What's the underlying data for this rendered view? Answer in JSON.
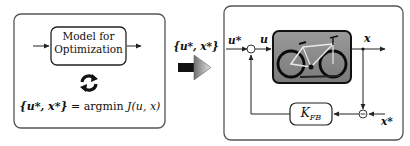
{
  "left_panel": {
    "model_box_line1": "Model for",
    "model_box_line2": "Optimization",
    "loop_icon": "refresh-cycle-icon",
    "equation": {
      "lhs": "{u*, x*}",
      "eq": "=",
      "rhs_op": "argmin",
      "rhs_func": "J(u, x)"
    }
  },
  "transfer": {
    "label": "{u*, x*}",
    "arrow_icon": "right-arrow-icon"
  },
  "right_panel": {
    "input_label": "u*",
    "control_label": "u",
    "output_label": "x",
    "reference_label": "x*",
    "plant_image": "bicycle-photo",
    "feedback_block": "K",
    "feedback_sub": "FB",
    "sum_sign_top": "+",
    "sum_sign_bottom": "−"
  },
  "colors": {
    "panel_border": "#555555",
    "plant_bg": "#8a8a8a",
    "arrow_dark": "#111111",
    "arrow_grad_light": "#e0e0e0",
    "arrow_grad_dark": "#7a7a7a"
  }
}
